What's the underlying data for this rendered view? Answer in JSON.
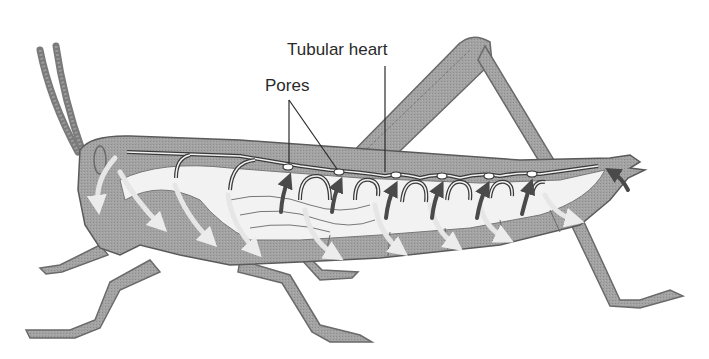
{
  "figure": {
    "labels": {
      "tubular_heart": "Tubular heart",
      "pores": "Pores"
    },
    "colors": {
      "body_fill": "#9a9a9a",
      "body_light": "#bdbdbd",
      "cavity_fill": "#f2f2f2",
      "outline": "#5a5a5a",
      "heart_stroke": "#3a3a3a",
      "arrow_dark": "#4a4a4a",
      "arrow_light": "#e6e6e6",
      "text": "#2a2a2a"
    },
    "pore_count": 6,
    "dark_arrow_count": 7
  }
}
